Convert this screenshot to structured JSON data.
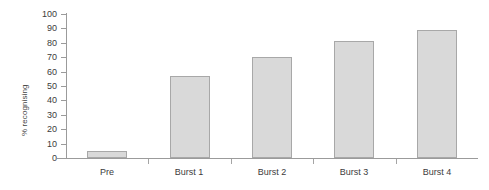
{
  "chart_data": {
    "type": "bar",
    "title": "",
    "subtitle": "",
    "xlabel": "",
    "ylabel": "% recognising",
    "categories": [
      "Pre",
      "Burst 1",
      "Burst 2",
      "Burst 3",
      "Burst 4"
    ],
    "values": [
      5,
      57,
      70,
      81,
      89
    ],
    "series": [
      {
        "name": "% recognising",
        "values": [
          5,
          57,
          70,
          81,
          89
        ]
      }
    ],
    "ylim": [
      0,
      100
    ],
    "y_tick_step": 10,
    "y_ticks": [
      "0",
      "10",
      "20",
      "30",
      "40",
      "50",
      "60",
      "70",
      "80",
      "90",
      "100"
    ],
    "grid": false,
    "legend": false,
    "legend_position": "none",
    "annotations": [],
    "colors": {
      "bar_fill": "#d9d9d9",
      "bar_border": "#a8a8a8",
      "axis": "#9b9b9b",
      "text": "#3c3c3c",
      "background": "#ffffff"
    }
  }
}
